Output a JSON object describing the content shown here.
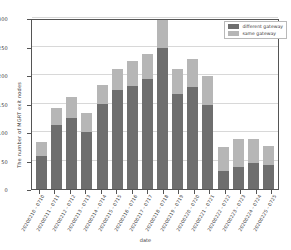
{
  "chart_data": {
    "type": "bar",
    "title": "",
    "xlabel": "date",
    "ylabel": "The number of MGRT exit nodes",
    "ylim": [
      0,
      300
    ],
    "yticks": [
      0,
      50,
      100,
      150,
      200,
      250,
      300
    ],
    "grid": true,
    "stacked": true,
    "legend_position": "upper right",
    "categories": [
      "20200210 - 0710",
      "20200211 - 0711",
      "20200212 - 0712",
      "20200213 - 0713",
      "20200214 - 0714",
      "20200215 - 0715",
      "20200216 - 0716",
      "20200217 - 0717",
      "20200218 - 0718",
      "20200219 - 0719",
      "20200220 - 0720",
      "20200221 - 0721",
      "20200222 - 0722",
      "20200223 - 0723",
      "20200224 - 0724",
      "20200225 - 0725"
    ],
    "series": [
      {
        "name": "different gateway",
        "color": "#6e6e6e",
        "values": [
          58,
          112,
          124,
          100,
          150,
          173,
          180,
          193,
          250,
          167,
          179,
          147,
          31,
          39,
          45,
          43
        ]
      },
      {
        "name": "same gateway",
        "color": "#b6b6b6",
        "values": [
          24,
          30,
          38,
          34,
          33,
          37,
          45,
          44,
          50,
          43,
          49,
          51,
          42,
          48,
          43,
          32
        ]
      }
    ],
    "totals": [
      82,
      142,
      162,
      134,
      183,
      210,
      225,
      237,
      300,
      210,
      228,
      198,
      73,
      87,
      88,
      75
    ]
  },
  "legend": {
    "entries": [
      {
        "label": "different gateway",
        "color": "#6e6e6e"
      },
      {
        "label": "same gateway",
        "color": "#b6b6b6"
      }
    ]
  },
  "axes": {
    "y_title": "The number of MGRT exit nodes",
    "x_title": "date",
    "y_ticks": [
      "0",
      "50",
      "100",
      "150",
      "200",
      "250",
      "300"
    ]
  }
}
